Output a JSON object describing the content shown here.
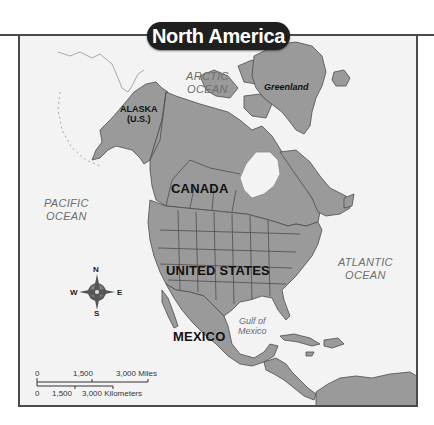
{
  "title": "North America",
  "labels": {
    "arctic_ocean": [
      "ARCTIC",
      "OCEAN"
    ],
    "pacific_ocean": [
      "PACIFIC",
      "OCEAN"
    ],
    "atlantic_ocean": [
      "ATLANTIC",
      "OCEAN"
    ],
    "gulf_of_mexico": [
      "Gulf of",
      "Mexico"
    ],
    "greenland": "Greenland",
    "alaska": [
      "ALASKA",
      "(U.S.)"
    ],
    "canada": "CANADA",
    "united_states": "UNITED STATES",
    "mexico": "MEXICO"
  },
  "compass": {
    "n": "N",
    "s": "S",
    "e": "E",
    "w": "W"
  },
  "scale": {
    "miles": {
      "ticks": [
        "0",
        "1,500",
        "3,000 Miles"
      ]
    },
    "kilometers": {
      "ticks": [
        "0",
        "1,500",
        "3,000 Kilometers"
      ]
    }
  },
  "colors": {
    "land": "#9a9a9a",
    "land_border": "#4d4d4d",
    "water": "#f3f3f3",
    "frame": "#4a4a4a",
    "title_bg": "#1f1f1f"
  }
}
